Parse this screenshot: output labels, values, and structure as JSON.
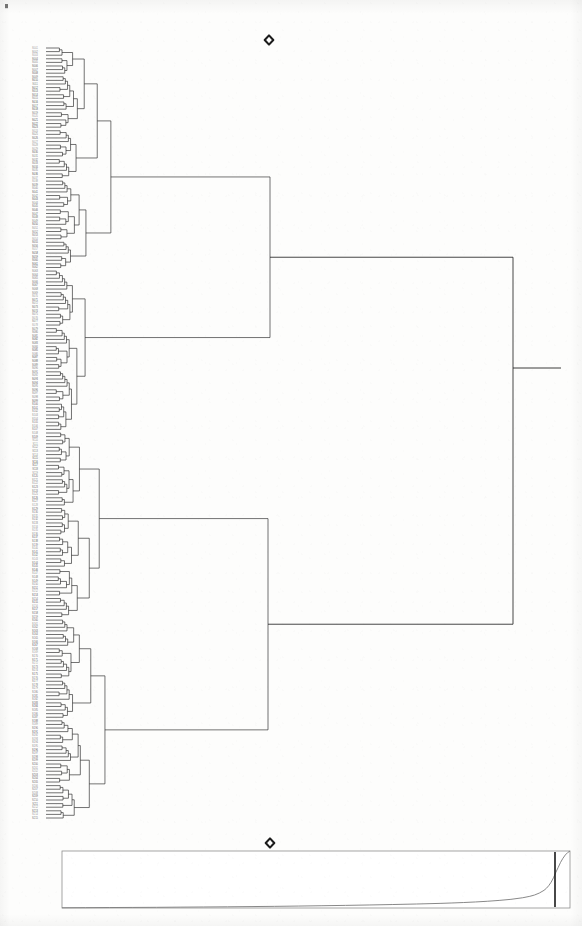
{
  "figure": {
    "kind": "dendrogram-with-scree-panel",
    "orientation": "horizontal-left-to-right",
    "title": "",
    "background_color": "#fdfdfc",
    "line_color": "#262626",
    "leaf_count": 215
  },
  "markers": {
    "top_marker": {
      "name": "diamond-marker-top",
      "glyph": "diamond",
      "x": 269,
      "y": 40,
      "size": 9,
      "color": "#1c1c1c"
    },
    "panel_marker": {
      "name": "diamond-marker-panel",
      "glyph": "diamond",
      "x": 270,
      "y": 843,
      "size": 9,
      "color": "#1c1c1c"
    },
    "corner_speck": {
      "name": "scan-speck-top-left",
      "x": 5,
      "y": 4,
      "size": 3,
      "color": "#4a4a4a"
    }
  },
  "dendrogram": {
    "name": "hierarchical-clustering-dendrogram",
    "leaf_x": 46,
    "leaf_top_y": 48,
    "leaf_bottom_y": 818,
    "leaf_spacing": 3.58,
    "root_x": 513,
    "root_stub_x": 561,
    "root_y": 368,
    "axis_note": "distance increases to the right",
    "label_column_x": 38,
    "major_clusters": [
      {
        "id": "A",
        "label": "cluster-A",
        "join_x": 160,
        "top_y": 52,
        "bottom_y": 268,
        "node_y": 198
      },
      {
        "id": "B",
        "label": "cluster-B",
        "join_x": 270,
        "top_y": 311,
        "bottom_y": 430,
        "node_y": 368
      },
      {
        "id": "C",
        "label": "cluster-C",
        "join_x": 268,
        "top_y": 472,
        "bottom_y": 700,
        "node_y": 535
      },
      {
        "id": "D",
        "label": "cluster-D",
        "join_x": 193,
        "top_y": 620,
        "bottom_y": 800,
        "node_y": 706
      }
    ],
    "leaf_labels_note": "leaf tip identifiers, illegible at scan resolution",
    "leaf_labels": [
      "S001",
      "S002",
      "S003",
      "S004",
      "S005",
      "S006",
      "S007",
      "S008",
      "S009",
      "S010",
      "S011",
      "S012",
      "S013",
      "S014",
      "S015",
      "S016",
      "S017",
      "S018",
      "S019",
      "S020",
      "S021",
      "S022",
      "S023",
      "S024",
      "S025",
      "S026",
      "S027",
      "S028",
      "S029",
      "S030",
      "S031",
      "S032",
      "S033",
      "S034",
      "S035",
      "S036",
      "S037",
      "S038",
      "S039",
      "S040",
      "S041",
      "S042",
      "S043",
      "S044",
      "S045",
      "S046",
      "S047",
      "S048",
      "S049",
      "S050",
      "S051",
      "S052",
      "S053",
      "S054",
      "S055",
      "S056",
      "S057",
      "S058",
      "S059",
      "S060",
      "S061",
      "S062",
      "S063",
      "S064",
      "S065",
      "S066",
      "S067",
      "S068",
      "S069",
      "S070",
      "S071",
      "S072",
      "S073",
      "S074",
      "S075",
      "S076",
      "S077",
      "S078",
      "S079",
      "S080",
      "S081",
      "S082",
      "S083",
      "S084",
      "S085",
      "S086",
      "S087",
      "S088",
      "S089",
      "S090",
      "S091",
      "S092",
      "S093",
      "S094",
      "S095",
      "S096",
      "S097",
      "S098",
      "S099",
      "S100",
      "S101",
      "S102",
      "S103",
      "S104",
      "S105",
      "S106",
      "S107",
      "S108",
      "S109",
      "S110",
      "S111",
      "S112",
      "S113",
      "S114",
      "S115",
      "S116",
      "S117",
      "S118",
      "S119",
      "S120",
      "S121",
      "S122",
      "S123",
      "S124",
      "S125",
      "S126",
      "S127",
      "S128",
      "S129",
      "S130",
      "S131",
      "S132",
      "S133",
      "S134",
      "S135",
      "S136",
      "S137",
      "S138",
      "S139",
      "S140",
      "S141",
      "S142",
      "S143",
      "S144",
      "S145",
      "S146",
      "S147",
      "S148",
      "S149",
      "S150",
      "S151",
      "S152",
      "S153",
      "S154",
      "S155",
      "S156",
      "S157",
      "S158",
      "S159",
      "S160",
      "S161",
      "S162",
      "S163",
      "S164",
      "S165",
      "S166",
      "S167",
      "S168",
      "S169",
      "S170",
      "S171",
      "S172",
      "S173",
      "S174",
      "S175",
      "S176",
      "S177",
      "S178",
      "S179",
      "S180",
      "S181",
      "S182",
      "S183",
      "S184",
      "S185",
      "S186",
      "S187",
      "S188",
      "S189",
      "S190",
      "S191",
      "S192",
      "S193",
      "S194",
      "S195",
      "S196",
      "S197",
      "S198",
      "S199",
      "S200",
      "S201",
      "S202",
      "S203",
      "S204",
      "S205",
      "S206",
      "S207",
      "S208",
      "S209",
      "S210",
      "S211",
      "S212",
      "S213",
      "S214",
      "S215"
    ]
  },
  "scree_panel": {
    "name": "merge-distance-scree-plot",
    "box": {
      "x": 62,
      "y": 851,
      "width": 508,
      "height": 57
    },
    "border_color": "#8e8e8e",
    "curve_color": "#7a7a7a",
    "cut_line": {
      "name": "cluster-cut-line",
      "x": 555,
      "color": "#1a1a1a",
      "width": 1.6
    },
    "baseline_y": 905,
    "description": "flat near-zero merge distances that rise sharply at the far right"
  },
  "chart_data": {
    "type": "line",
    "title": "",
    "subtitle": "",
    "xlabel": "",
    "ylabel": "",
    "grid": false,
    "legend": null,
    "xlim": [
      0,
      215
    ],
    "ylim": [
      0,
      1
    ],
    "annotations": [
      {
        "name": "cut-line",
        "type": "vline",
        "x": 207,
        "label": ""
      },
      {
        "name": "diamond-top",
        "type": "marker",
        "label": ""
      },
      {
        "name": "diamond-panel",
        "type": "marker",
        "label": ""
      }
    ],
    "series": [
      {
        "name": "merge distance",
        "x": [
          0,
          10,
          20,
          30,
          40,
          50,
          60,
          70,
          80,
          90,
          100,
          110,
          120,
          130,
          140,
          150,
          160,
          165,
          170,
          175,
          180,
          185,
          190,
          195,
          198,
          200,
          202,
          204,
          205,
          206,
          207,
          208,
          209,
          210,
          211,
          212,
          213,
          214,
          215
        ],
        "values": [
          0.004,
          0.006,
          0.008,
          0.01,
          0.012,
          0.015,
          0.018,
          0.021,
          0.025,
          0.029,
          0.034,
          0.04,
          0.046,
          0.053,
          0.061,
          0.07,
          0.081,
          0.088,
          0.096,
          0.106,
          0.118,
          0.133,
          0.152,
          0.18,
          0.205,
          0.228,
          0.262,
          0.31,
          0.345,
          0.392,
          0.452,
          0.53,
          0.625,
          0.712,
          0.8,
          0.872,
          0.93,
          0.972,
          1.0
        ]
      }
    ]
  }
}
